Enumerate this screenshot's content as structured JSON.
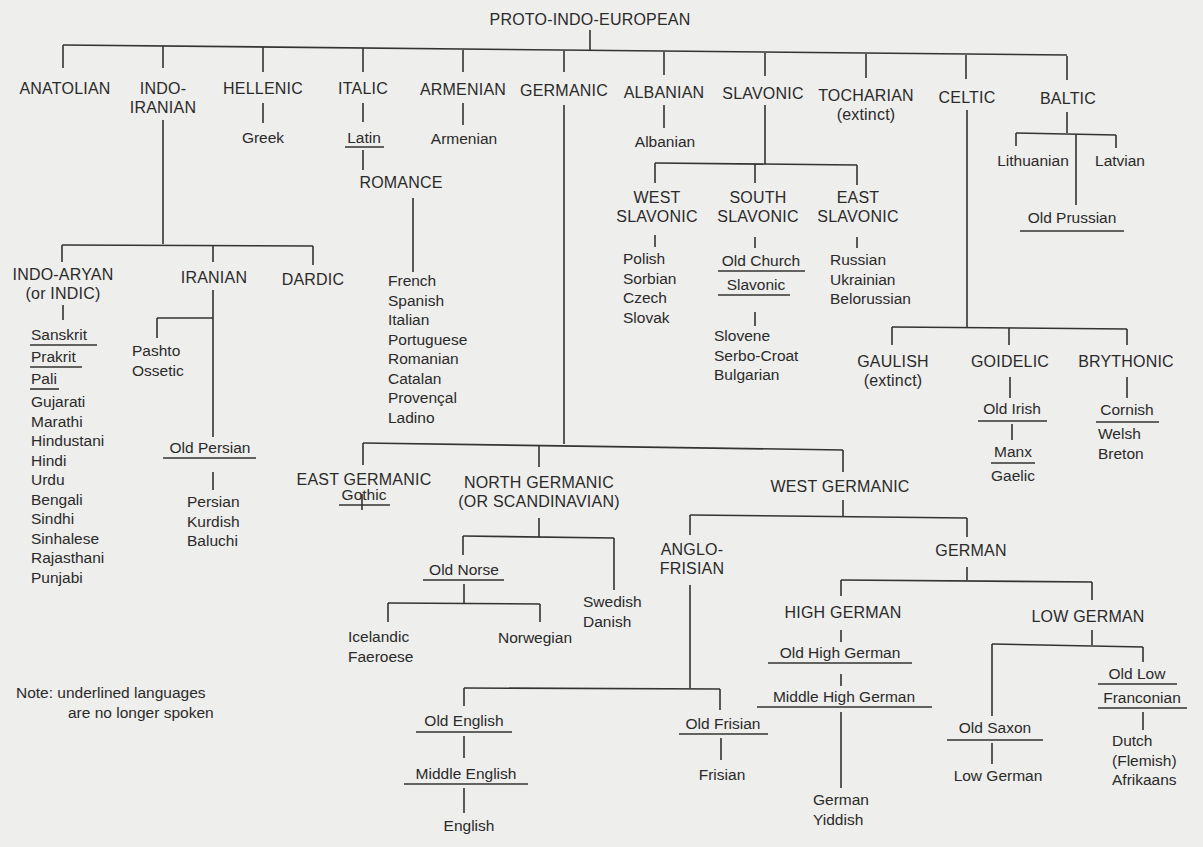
{
  "title": "PROTO-INDO-EUROPEAN",
  "branches": {
    "anatolian": "ANATOLIAN",
    "indo_iranian": [
      "INDO-",
      "IRANIAN"
    ],
    "hellenic": "HELLENIC",
    "italic": "ITALIC",
    "armenian": "ARMENIAN",
    "germanic": "GERMANIC",
    "albanian": "ALBANIAN",
    "slavonic": "SLAVONIC",
    "tocharian": [
      "TOCHARIAN",
      "(extinct)"
    ],
    "celtic": "CELTIC",
    "baltic": "BALTIC"
  },
  "hellenic": {
    "children": [
      "Greek"
    ]
  },
  "italic": {
    "latin": "Latin",
    "romance": "ROMANCE",
    "languages": [
      "French",
      "Spanish",
      "Italian",
      "Portuguese",
      "Romanian",
      "Catalan",
      "Provençal",
      "Ladino"
    ]
  },
  "armenian": {
    "children": [
      "Armenian"
    ]
  },
  "albanian": {
    "children": [
      "Albanian"
    ]
  },
  "indo_iranian": {
    "indo_aryan": [
      "INDO-ARYAN",
      "(or INDIC)"
    ],
    "indo_aryan_extinct": [
      "Sanskrit",
      "Prakrit",
      "Pali"
    ],
    "indo_aryan_languages": [
      "Gujarati",
      "Marathi",
      "Hindustani",
      "Hindi",
      "Urdu",
      "Bengali",
      "Sindhi",
      "Sinhalese",
      "Rajasthani",
      "Punjabi"
    ],
    "iranian": "IRANIAN",
    "iranian_east": [
      "Pashto",
      "Ossetic"
    ],
    "old_persian": "Old Persian",
    "iranian_west": [
      "Persian",
      "Kurdish",
      "Baluchi"
    ],
    "dardic": "DARDIC"
  },
  "slavonic": {
    "west": [
      "WEST",
      "SLAVONIC"
    ],
    "west_languages": [
      "Polish",
      "Sorbian",
      "Czech",
      "Slovak"
    ],
    "south": [
      "SOUTH",
      "SLAVONIC"
    ],
    "old_church": [
      "Old Church",
      "Slavonic"
    ],
    "south_languages": [
      "Slovene",
      "Serbo-Croat",
      "Bulgarian"
    ],
    "east": [
      "EAST",
      "SLAVONIC"
    ],
    "east_languages": [
      "Russian",
      "Ukrainian",
      "Belorussian"
    ]
  },
  "baltic": {
    "lithuanian": "Lithuanian",
    "latvian": "Latvian",
    "old_prussian": "Old Prussian"
  },
  "celtic": {
    "gaulish": [
      "GAULISH",
      "(extinct)"
    ],
    "goidelic": "GOIDELIC",
    "old_irish": "Old Irish",
    "manx": "Manx",
    "gaelic": "Gaelic",
    "brythonic": "BRYTHONIC",
    "cornish": "Cornish",
    "brythonic_languages": [
      "Welsh",
      "Breton"
    ]
  },
  "germanic": {
    "east": "EAST GERMANIC",
    "gothic": "Gothic",
    "north": [
      "NORTH GERMANIC",
      "(OR SCANDINAVIAN)"
    ],
    "old_norse": "Old Norse",
    "icelandic": [
      "Icelandic",
      "Faeroese"
    ],
    "norwegian": "Norwegian",
    "swedish": [
      "Swedish",
      "Danish"
    ],
    "west": "WEST GERMANIC",
    "anglo_frisian": [
      "ANGLO-",
      "FRISIAN"
    ],
    "old_english": "Old English",
    "middle_english": "Middle English",
    "english": "English",
    "old_frisian": "Old Frisian",
    "frisian": "Frisian",
    "german": "GERMAN",
    "high_german": "HIGH GERMAN",
    "old_high_german": "Old High German",
    "middle_high_german": "Middle High German",
    "high_german_languages": [
      "German",
      "Yiddish"
    ],
    "low_german": "LOW GERMAN",
    "old_saxon": "Old Saxon",
    "low_german_lang": "Low German",
    "old_low_franconian": [
      "Old Low",
      "Franconian"
    ],
    "franconian_languages": [
      "Dutch",
      "(Flemish)",
      "Afrikaans"
    ]
  },
  "note": [
    "Note: underlined languages",
    "are no longer spoken"
  ]
}
